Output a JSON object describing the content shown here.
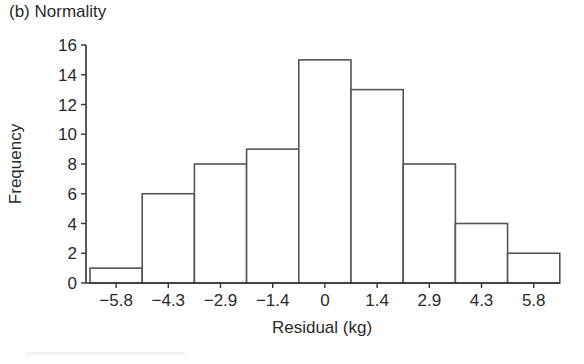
{
  "panel_title": "(b) Normality",
  "chart_data": {
    "type": "bar",
    "subtype": "histogram",
    "title": "(b) Normality",
    "xlabel": "Residual (kg)",
    "ylabel": "Frequency",
    "categories": [
      "−5.8",
      "−4.3",
      "−2.9",
      "−1.4",
      "0",
      "1.4",
      "2.9",
      "4.3",
      "5.8"
    ],
    "x": [
      -5.8,
      -4.3,
      -2.9,
      -1.4,
      0,
      1.4,
      2.9,
      4.3,
      5.8
    ],
    "values": [
      1,
      6,
      8,
      9,
      15,
      13,
      8,
      4,
      2
    ],
    "ylim": [
      0,
      16
    ],
    "yticks": [
      0,
      2,
      4,
      6,
      8,
      10,
      12,
      14,
      16
    ],
    "grid": false,
    "legend": null,
    "bar_fill": "#ffffff",
    "bar_edge": "#555555"
  }
}
